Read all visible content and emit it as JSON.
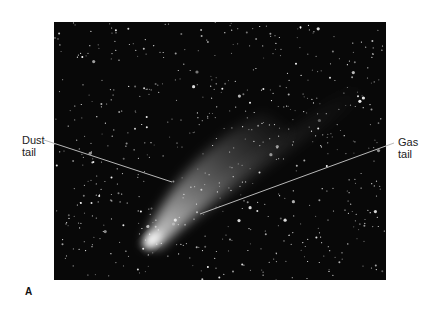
{
  "figure": {
    "panel_letter": "A",
    "labels": {
      "dust": [
        "Dust",
        "tail"
      ],
      "gas": [
        "Gas",
        "tail"
      ]
    },
    "colors": {
      "background": "#ffffff",
      "sky": "#080808",
      "leader_line": "#b0b0b0",
      "text": "#222222"
    }
  }
}
